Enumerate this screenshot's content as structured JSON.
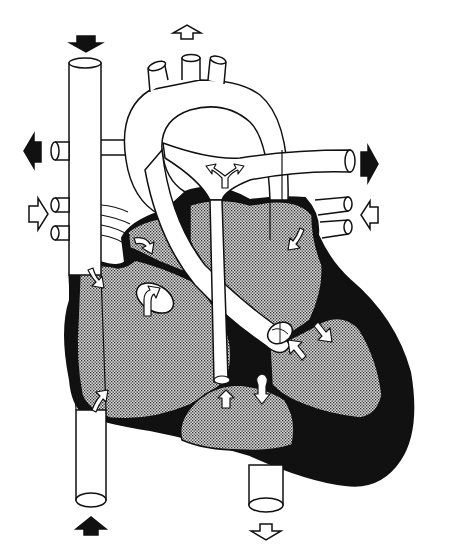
{
  "diagram": {
    "title": "Heart circulation diagram",
    "style": "black-and-white line drawing with stippled chambers",
    "colors": {
      "background": "#ffffff",
      "outline": "#111111",
      "myocardium": "#111111",
      "chamber_fill": "#b8b8b8",
      "vessel_fill": "#ffffff",
      "arrow_inflow": "#111111",
      "arrow_outflow": "#ffffff"
    },
    "structures": [
      {
        "id": "superior-vena-cava",
        "kind": "vessel"
      },
      {
        "id": "inferior-vena-cava",
        "kind": "vessel"
      },
      {
        "id": "aortic-arch",
        "kind": "vessel"
      },
      {
        "id": "aortic-arch-branches",
        "kind": "vessel",
        "count": 3
      },
      {
        "id": "pulmonary-artery",
        "kind": "vessel"
      },
      {
        "id": "ductus-arteriosus",
        "kind": "vessel"
      },
      {
        "id": "descending-aorta",
        "kind": "vessel"
      },
      {
        "id": "left-pulmonary-veins",
        "kind": "vessel",
        "count": 2
      },
      {
        "id": "right-pulmonary-veins",
        "kind": "vessel",
        "count": 2
      },
      {
        "id": "right-atrium",
        "kind": "chamber"
      },
      {
        "id": "left-atrium",
        "kind": "chamber"
      },
      {
        "id": "right-ventricle",
        "kind": "chamber"
      },
      {
        "id": "left-ventricle",
        "kind": "chamber"
      },
      {
        "id": "foramen-ovale-valve",
        "kind": "valve"
      },
      {
        "id": "aortic-valve",
        "kind": "valve"
      },
      {
        "id": "pulmonary-valve",
        "kind": "valve"
      }
    ],
    "external_arrows": [
      {
        "id": "arrow-top-svc",
        "direction": "down",
        "fill": "black"
      },
      {
        "id": "arrow-top-aorta",
        "direction": "up",
        "fill": "white"
      },
      {
        "id": "arrow-left-upper",
        "direction": "left",
        "fill": "black"
      },
      {
        "id": "arrow-left-lower",
        "direction": "right",
        "fill": "white"
      },
      {
        "id": "arrow-right-upper",
        "direction": "right",
        "fill": "black"
      },
      {
        "id": "arrow-right-lower",
        "direction": "left",
        "fill": "white"
      },
      {
        "id": "arrow-bottom-ivc",
        "direction": "up",
        "fill": "black"
      },
      {
        "id": "arrow-bottom-aorta",
        "direction": "down",
        "fill": "white"
      }
    ]
  }
}
